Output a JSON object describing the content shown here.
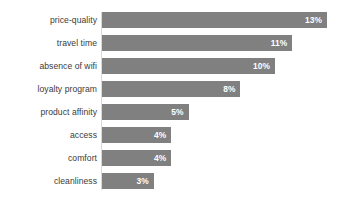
{
  "chart_data": {
    "type": "bar",
    "orientation": "horizontal",
    "title": "",
    "subtitle": "",
    "xlabel": "",
    "ylabel": "",
    "categories": [
      "price-quality",
      "travel time",
      "absence of wifi",
      "loyalty program",
      "product affinity",
      "access",
      "comfort",
      "cleanliness"
    ],
    "values": [
      13,
      11,
      10,
      8,
      5,
      4,
      4,
      3
    ],
    "value_labels": [
      "13%",
      "11%",
      "10%",
      "8%",
      "5%",
      "4%",
      "4%",
      "3%"
    ],
    "unit": "%",
    "xlim": [
      0,
      14.5
    ],
    "grid": false,
    "legend": null,
    "bar_color": "#808080",
    "value_label_color": "#ffffff",
    "category_label_color": "#3b3b3b",
    "background_color": "#ffffff",
    "bars": [
      {
        "category": "price-quality",
        "value": 13,
        "label": "13%"
      },
      {
        "category": "travel time",
        "value": 11,
        "label": "11%"
      },
      {
        "category": "absence of wifi",
        "value": 10,
        "label": "10%"
      },
      {
        "category": "loyalty program",
        "value": 8,
        "label": "8%"
      },
      {
        "category": "product affinity",
        "value": 5,
        "label": "5%"
      },
      {
        "category": "access",
        "value": 4,
        "label": "4%"
      },
      {
        "category": "comfort",
        "value": 4,
        "label": "4%"
      },
      {
        "category": "cleanliness",
        "value": 3,
        "label": "3%"
      }
    ]
  }
}
